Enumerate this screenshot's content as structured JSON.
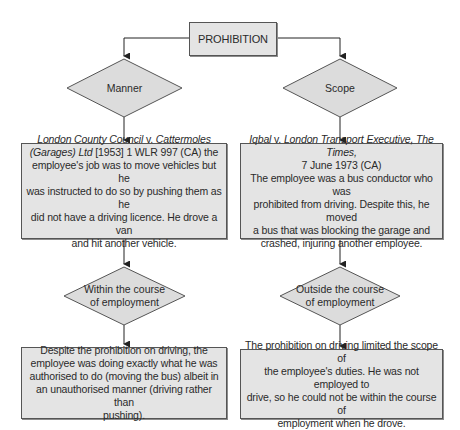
{
  "diagram": {
    "root": {
      "label": "PROHIBITION"
    },
    "branches": [
      {
        "decision": "Manner",
        "case": {
          "title_lines": [
            {
              "italic": "London County Council",
              "plain": " v. ",
              "italic2": "Cattermoles"
            },
            {
              "italic": "(Garages) Ltd",
              "plain": " [1953] 1 WLR 997 (CA) the"
            }
          ],
          "body_lines": [
            "employee's job was to move vehicles but he",
            "was instructed to do so by pushing them as he",
            "did not have a driving licence. He drove a van",
            "and hit another vehicle."
          ]
        },
        "result_decision_lines": [
          "Within the course",
          "of employment"
        ],
        "outcome_lines": [
          "Despite the prohibition on driving, the",
          "employee was doing exactly what he was",
          "authorised to do (moving the bus) albeit in",
          "an unauthorised manner (driving rather than",
          "pushing)."
        ]
      },
      {
        "decision": "Scope",
        "case": {
          "title_lines": [
            {
              "italic": "Iqbal",
              "plain": " v. ",
              "italic2": "London Transport Executive, The"
            },
            {
              "italic": "Times,",
              "plain": "",
              "italic2": ""
            }
          ],
          "citation": "7 June 1973 (CA)",
          "body_lines": [
            "The employee was a bus conductor who was",
            "prohibited from driving. Despite this, he moved",
            "a bus that was blocking the garage and",
            "crashed, injuring another employee."
          ]
        },
        "result_decision_lines": [
          "Outside the course",
          "of employment"
        ],
        "outcome_lines": [
          "The prohibition on driving limited the scope of",
          "the employee's duties. He was not employed to",
          "drive, so he could not be within the course of",
          "employment when he drove."
        ]
      }
    ]
  },
  "colors": {
    "box_fill": "#e4e4e4",
    "diamond_fill": "#dcdcdc",
    "stroke": "#555555",
    "line": "#222222",
    "text": "#2a2a2a"
  }
}
